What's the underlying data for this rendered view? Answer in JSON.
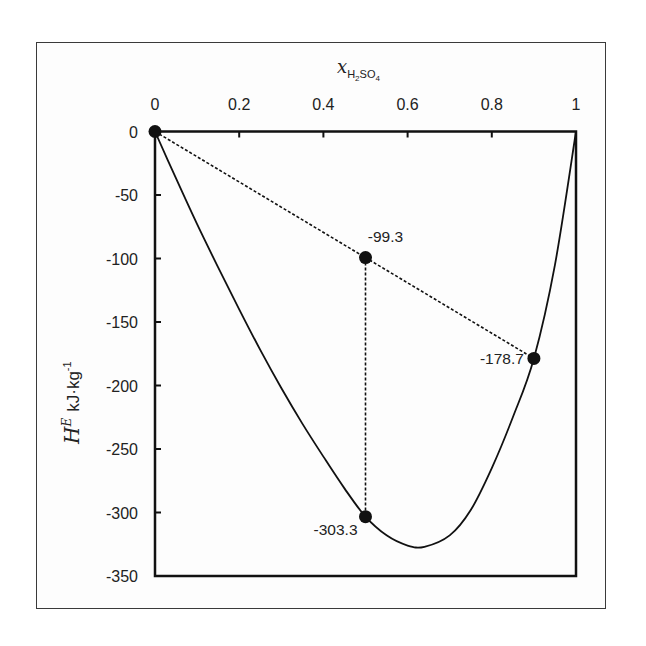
{
  "chart_data": {
    "type": "line",
    "title": "",
    "xlabel": "x_H2SO4",
    "xlabel_parts": {
      "main": "x",
      "sub1": "H",
      "sub2": "2",
      "sub3": "SO",
      "sub4": "4"
    },
    "ylabel": "H^E kJ·kg^-1",
    "ylabel_parts": {
      "main": "H",
      "sup": "E",
      "unit": "kJ·kg",
      "unit_sup": "-1"
    },
    "xlim": [
      0,
      1
    ],
    "ylim": [
      -350,
      0
    ],
    "x_axis_position": "top",
    "grid": false,
    "legend": null,
    "x_ticks": [
      0,
      0.2,
      0.4,
      0.6,
      0.8,
      1
    ],
    "x_tick_labels": [
      "0",
      "0.2",
      "0.4",
      "0.6",
      "0.8",
      "1"
    ],
    "y_ticks": [
      0,
      -50,
      -100,
      -150,
      -200,
      -250,
      -300,
      -350
    ],
    "y_tick_labels": [
      "0",
      "-50",
      "-100",
      "-150",
      "-200",
      "-250",
      "-300",
      "-350"
    ],
    "series": [
      {
        "name": "Excess enthalpy curve",
        "style": "solid",
        "x": [
          0,
          0.05,
          0.1,
          0.15,
          0.2,
          0.25,
          0.3,
          0.35,
          0.4,
          0.45,
          0.5,
          0.55,
          0.6,
          0.64,
          0.7,
          0.75,
          0.8,
          0.85,
          0.9,
          0.95,
          1.0
        ],
        "y": [
          0,
          -37,
          -73,
          -107,
          -140,
          -172,
          -202,
          -230,
          -256,
          -281,
          -303.3,
          -318,
          -326,
          -327,
          -318,
          -298,
          -265,
          -225,
          -178.7,
          -105,
          0
        ]
      },
      {
        "name": "Mixing tie line",
        "style": "dashed",
        "x": [
          0,
          0.5,
          0.9
        ],
        "y": [
          0,
          -99.3,
          -178.7
        ]
      },
      {
        "name": "Vertical drop",
        "style": "dashed",
        "x": [
          0.5,
          0.5
        ],
        "y": [
          -99.3,
          -303.3
        ]
      }
    ],
    "points": [
      {
        "x": 0,
        "y": 0,
        "label": ""
      },
      {
        "x": 0.5,
        "y": -99.3,
        "label": "-99.3"
      },
      {
        "x": 0.9,
        "y": -178.7,
        "label": "-178.7"
      },
      {
        "x": 0.5,
        "y": -303.3,
        "label": "-303.3"
      }
    ]
  }
}
